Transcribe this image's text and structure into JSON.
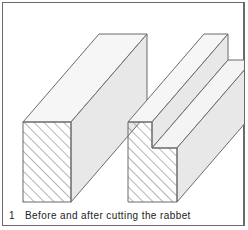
{
  "figure": {
    "number": "1",
    "caption": "Before and after cutting the rabbet",
    "colors": {
      "line": "#6b6b6b",
      "top_face": "#f4f4f4",
      "side_face": "#e6e6e6",
      "hatch": "#777777",
      "frame": "#6a6a6a"
    },
    "panels": [
      {
        "name": "before",
        "description": "Rectangular board with hatched end grain"
      },
      {
        "name": "after",
        "description": "Board with rabbet cut along top-right edge, hatched end grain"
      }
    ]
  }
}
